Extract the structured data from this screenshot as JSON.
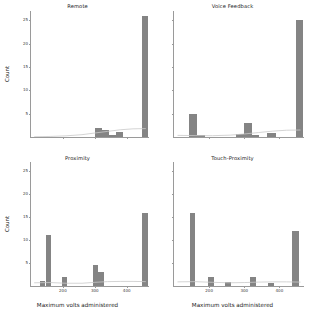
{
  "figure": {
    "shared_y_axis_title": "Count",
    "shared_x_axis_title": "Maximum volts administered",
    "bar_color": "#848484",
    "curve_color": "#c9c9c9",
    "axis_color": "#9a9a9a",
    "background": "#ffffff"
  },
  "chart_data": {
    "type": "bar",
    "title": "",
    "xlabel": "Maximum volts administered",
    "ylabel": "Count",
    "xlim": [
      100,
      470
    ],
    "ylim": [
      0,
      27
    ],
    "xticks": [
      200,
      300,
      400
    ],
    "yticks": [
      5,
      10,
      15,
      20,
      25
    ],
    "grid": false,
    "legend": "none",
    "annotation": "Four faceted histograms of maximum volts administered, one per condition, each overlaid with a light gray smoothed density curve.",
    "panels": [
      {
        "name": "Remote",
        "title": "Remote",
        "position": "top-left",
        "bars": [
          {
            "x": 300,
            "width": 22,
            "count": 2
          },
          {
            "x": 322,
            "width": 22,
            "count": 1.5
          },
          {
            "x": 344,
            "width": 22,
            "count": 0.5
          },
          {
            "x": 366,
            "width": 22,
            "count": 1
          },
          {
            "x": 448,
            "width": 20,
            "count": 26
          }
        ],
        "curve": [
          {
            "x": 110,
            "y": 0.05
          },
          {
            "x": 160,
            "y": 0.12
          },
          {
            "x": 210,
            "y": 0.25
          },
          {
            "x": 260,
            "y": 0.5
          },
          {
            "x": 300,
            "y": 0.85
          },
          {
            "x": 340,
            "y": 1.2
          },
          {
            "x": 380,
            "y": 1.55
          },
          {
            "x": 420,
            "y": 1.75
          },
          {
            "x": 460,
            "y": 1.8
          }
        ]
      },
      {
        "name": "Voice Feedback",
        "title": "Voice Feedback",
        "position": "top-right",
        "bars": [
          {
            "x": 143,
            "width": 22,
            "count": 5
          },
          {
            "x": 165,
            "width": 22,
            "count": 0.4
          },
          {
            "x": 277,
            "width": 22,
            "count": 0.6
          },
          {
            "x": 299,
            "width": 22,
            "count": 3
          },
          {
            "x": 321,
            "width": 22,
            "count": 0.5
          },
          {
            "x": 365,
            "width": 24,
            "count": 0.9
          },
          {
            "x": 448,
            "width": 20,
            "count": 25
          }
        ],
        "curve": [
          {
            "x": 110,
            "y": 0.35
          },
          {
            "x": 160,
            "y": 0.3
          },
          {
            "x": 210,
            "y": 0.28
          },
          {
            "x": 260,
            "y": 0.4
          },
          {
            "x": 300,
            "y": 0.65
          },
          {
            "x": 340,
            "y": 0.95
          },
          {
            "x": 380,
            "y": 1.25
          },
          {
            "x": 420,
            "y": 1.45
          },
          {
            "x": 460,
            "y": 1.5
          }
        ]
      },
      {
        "name": "Proximity",
        "title": "Proximity",
        "position": "bottom-left",
        "bars": [
          {
            "x": 128,
            "width": 16,
            "count": 1
          },
          {
            "x": 147,
            "width": 16,
            "count": 11
          },
          {
            "x": 196,
            "width": 18,
            "count": 2
          },
          {
            "x": 293,
            "width": 18,
            "count": 4.5
          },
          {
            "x": 311,
            "width": 18,
            "count": 3
          },
          {
            "x": 447,
            "width": 20,
            "count": 16
          }
        ],
        "curve": [
          {
            "x": 110,
            "y": 0.7
          },
          {
            "x": 160,
            "y": 0.75
          },
          {
            "x": 210,
            "y": 0.6
          },
          {
            "x": 260,
            "y": 0.6
          },
          {
            "x": 300,
            "y": 0.8
          },
          {
            "x": 340,
            "y": 0.95
          },
          {
            "x": 380,
            "y": 1.0
          },
          {
            "x": 420,
            "y": 1.0
          },
          {
            "x": 460,
            "y": 0.95
          }
        ]
      },
      {
        "name": "Touch-Proximity",
        "title": "Touch-Proximity",
        "position": "bottom-right",
        "bars": [
          {
            "x": 145,
            "width": 16,
            "count": 16
          },
          {
            "x": 197,
            "width": 18,
            "count": 2
          },
          {
            "x": 245,
            "width": 16,
            "count": 0.8
          },
          {
            "x": 315,
            "width": 18,
            "count": 2
          },
          {
            "x": 368,
            "width": 16,
            "count": 0.7
          },
          {
            "x": 437,
            "width": 20,
            "count": 12
          }
        ],
        "curve": [
          {
            "x": 110,
            "y": 0.9
          },
          {
            "x": 160,
            "y": 0.95
          },
          {
            "x": 210,
            "y": 0.8
          },
          {
            "x": 260,
            "y": 0.7
          },
          {
            "x": 300,
            "y": 0.75
          },
          {
            "x": 340,
            "y": 0.85
          },
          {
            "x": 380,
            "y": 0.9
          },
          {
            "x": 420,
            "y": 0.9
          },
          {
            "x": 460,
            "y": 0.85
          }
        ]
      }
    ]
  }
}
